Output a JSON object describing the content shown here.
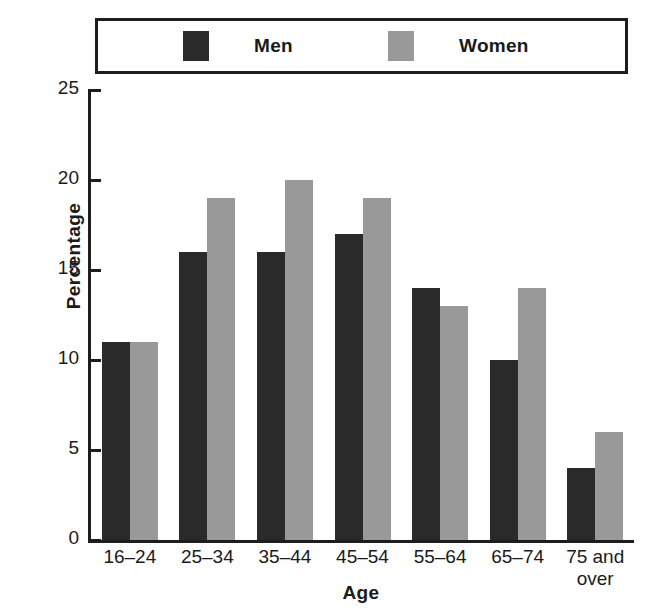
{
  "legend": {
    "entries": [
      {
        "label": "Men",
        "color": "#2a2a2a"
      },
      {
        "label": "Women",
        "color": "#999999"
      }
    ]
  },
  "axes": {
    "y_title": "Percentage",
    "x_title": "Age",
    "y_ticks": [
      "25",
      "20",
      "15",
      "10",
      "5",
      "0"
    ]
  },
  "chart_data": {
    "type": "bar",
    "title": "",
    "xlabel": "Age",
    "ylabel": "Percentage",
    "ylim": [
      0,
      25
    ],
    "ytick_values": [
      0,
      5,
      10,
      15,
      20,
      25
    ],
    "grid": false,
    "legend_position": "top",
    "categories": [
      "16–24",
      "25–34",
      "35–44",
      "45–54",
      "55–64",
      "65–74",
      "75 and over"
    ],
    "category_labels": [
      [
        "16–24"
      ],
      [
        "25–34"
      ],
      [
        "35–44"
      ],
      [
        "45–54"
      ],
      [
        "55–64"
      ],
      [
        "65–74"
      ],
      [
        "75 and",
        "over"
      ]
    ],
    "series": [
      {
        "name": "Men",
        "color": "#2a2a2a",
        "values": [
          11,
          16,
          16,
          17,
          14,
          10,
          4
        ]
      },
      {
        "name": "Women",
        "color": "#999999",
        "values": [
          11,
          19,
          20,
          19,
          13,
          14,
          6
        ]
      }
    ]
  }
}
